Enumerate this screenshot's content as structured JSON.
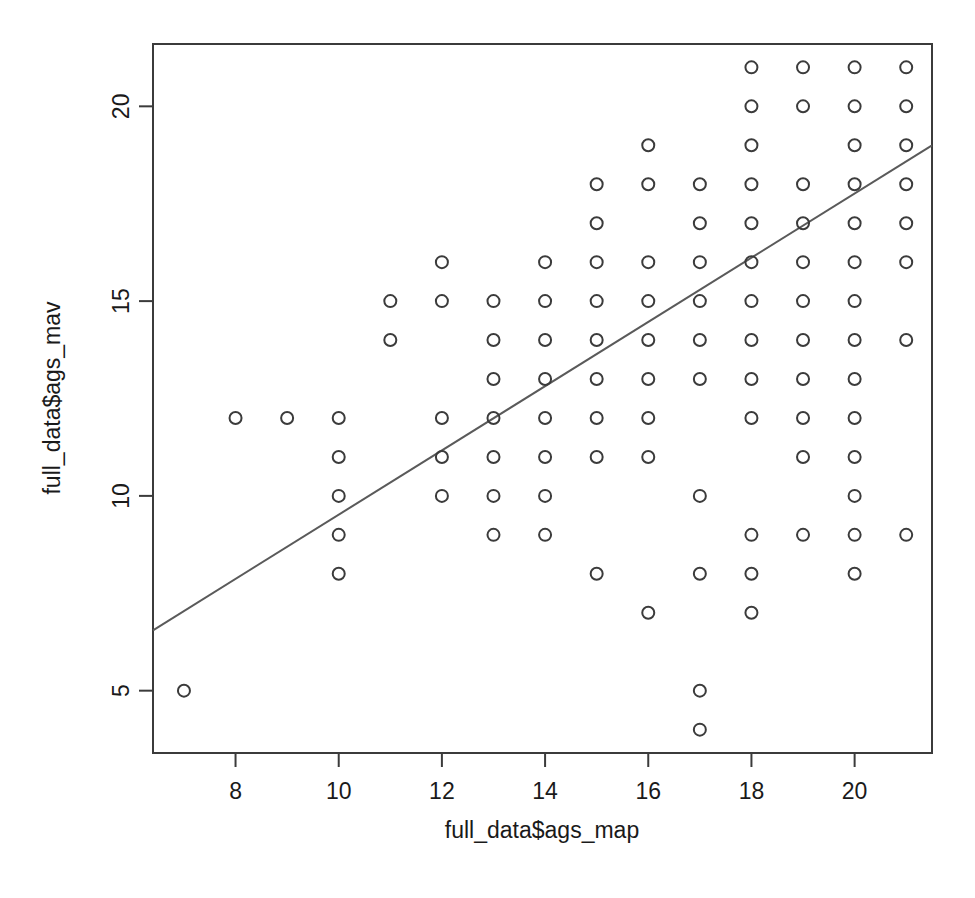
{
  "chart_data": {
    "type": "scatter",
    "title": "",
    "xlabel": "full_data$ags_map",
    "ylabel": "full_data$ags_mav",
    "xlim": [
      6.4,
      21.5
    ],
    "ylim": [
      3.4,
      21.6
    ],
    "xticks": [
      8,
      10,
      12,
      14,
      16,
      18,
      20
    ],
    "xtick_labels": [
      "8",
      "10",
      "12",
      "14",
      "16",
      "18",
      "20"
    ],
    "yticks": [
      5,
      10,
      15,
      20
    ],
    "ytick_labels": [
      "5",
      "10",
      "15",
      "20"
    ],
    "grid": false,
    "legend": null,
    "marker": "open-circle",
    "marker_color": "#3b3b3b",
    "marker_radius_px": 6,
    "frame_color": "#3b3b3b",
    "points": [
      [
        7,
        5
      ],
      [
        8,
        12
      ],
      [
        9,
        12
      ],
      [
        10,
        12
      ],
      [
        10,
        11
      ],
      [
        10,
        10
      ],
      [
        10,
        9
      ],
      [
        10,
        8
      ],
      [
        11,
        15
      ],
      [
        11,
        14
      ],
      [
        12,
        16
      ],
      [
        12,
        15
      ],
      [
        12,
        12
      ],
      [
        12,
        11
      ],
      [
        12,
        10
      ],
      [
        13,
        15
      ],
      [
        13,
        14
      ],
      [
        13,
        13
      ],
      [
        13,
        12
      ],
      [
        13,
        11
      ],
      [
        13,
        10
      ],
      [
        13,
        9
      ],
      [
        14,
        16
      ],
      [
        14,
        15
      ],
      [
        14,
        14
      ],
      [
        14,
        13
      ],
      [
        14,
        12
      ],
      [
        14,
        11
      ],
      [
        14,
        10
      ],
      [
        14,
        9
      ],
      [
        15,
        18
      ],
      [
        15,
        17
      ],
      [
        15,
        16
      ],
      [
        15,
        15
      ],
      [
        15,
        14
      ],
      [
        15,
        13
      ],
      [
        15,
        12
      ],
      [
        15,
        11
      ],
      [
        15,
        8
      ],
      [
        16,
        19
      ],
      [
        16,
        18
      ],
      [
        16,
        16
      ],
      [
        16,
        15
      ],
      [
        16,
        14
      ],
      [
        16,
        13
      ],
      [
        16,
        12
      ],
      [
        16,
        11
      ],
      [
        16,
        7
      ],
      [
        17,
        18
      ],
      [
        17,
        17
      ],
      [
        17,
        16
      ],
      [
        17,
        15
      ],
      [
        17,
        14
      ],
      [
        17,
        13
      ],
      [
        17,
        10
      ],
      [
        17,
        8
      ],
      [
        17,
        5
      ],
      [
        17,
        4
      ],
      [
        18,
        21
      ],
      [
        18,
        20
      ],
      [
        18,
        19
      ],
      [
        18,
        18
      ],
      [
        18,
        17
      ],
      [
        18,
        16
      ],
      [
        18,
        15
      ],
      [
        18,
        14
      ],
      [
        18,
        13
      ],
      [
        18,
        12
      ],
      [
        18,
        9
      ],
      [
        18,
        8
      ],
      [
        18,
        7
      ],
      [
        19,
        21
      ],
      [
        19,
        20
      ],
      [
        19,
        18
      ],
      [
        19,
        17
      ],
      [
        19,
        16
      ],
      [
        19,
        15
      ],
      [
        19,
        14
      ],
      [
        19,
        13
      ],
      [
        19,
        12
      ],
      [
        19,
        11
      ],
      [
        19,
        9
      ],
      [
        20,
        21
      ],
      [
        20,
        20
      ],
      [
        20,
        19
      ],
      [
        20,
        18
      ],
      [
        20,
        17
      ],
      [
        20,
        16
      ],
      [
        20,
        15
      ],
      [
        20,
        14
      ],
      [
        20,
        13
      ],
      [
        20,
        12
      ],
      [
        20,
        11
      ],
      [
        20,
        10
      ],
      [
        20,
        9
      ],
      [
        20,
        8
      ],
      [
        21,
        21
      ],
      [
        21,
        20
      ],
      [
        21,
        19
      ],
      [
        21,
        18
      ],
      [
        21,
        17
      ],
      [
        21,
        16
      ],
      [
        21,
        14
      ],
      [
        21,
        9
      ]
    ],
    "fit_line": {
      "type": "linear-regression",
      "color": "#5a5a5a",
      "x_start": 6.4,
      "y_start": 6.55,
      "x_end": 21.5,
      "y_end": 19.0
    }
  }
}
